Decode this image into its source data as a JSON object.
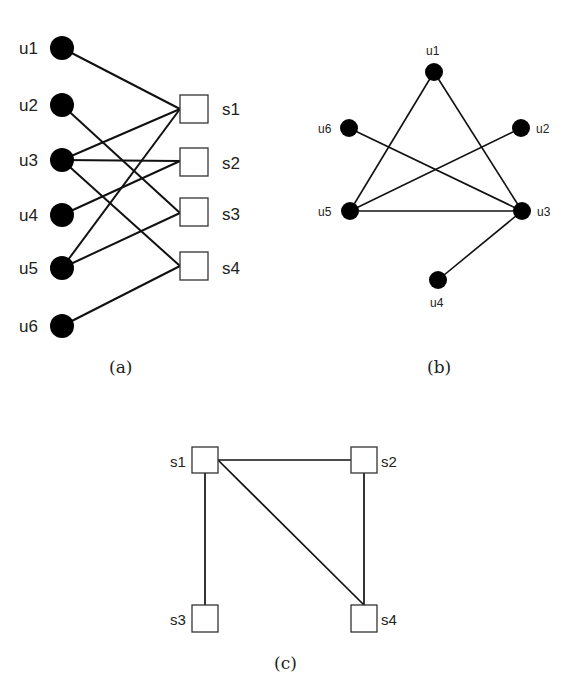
{
  "panels": [
    {
      "id": "a",
      "caption": "(a)",
      "description": "Bipartite graph between users and services",
      "user_nodes": [
        {
          "id": "u1",
          "label": "u1",
          "x": 62,
          "y": 48
        },
        {
          "id": "u2",
          "label": "u2",
          "x": 62,
          "y": 105
        },
        {
          "id": "u3",
          "label": "u3",
          "x": 62,
          "y": 160
        },
        {
          "id": "u4",
          "label": "u4",
          "x": 62,
          "y": 215
        },
        {
          "id": "u5",
          "label": "u5",
          "x": 62,
          "y": 268
        },
        {
          "id": "u6",
          "label": "u6",
          "x": 62,
          "y": 326
        }
      ],
      "service_nodes": [
        {
          "id": "s1",
          "label": "s1",
          "x": 194,
          "y": 109
        },
        {
          "id": "s2",
          "label": "s2",
          "x": 194,
          "y": 163
        },
        {
          "id": "s3",
          "label": "s3",
          "x": 194,
          "y": 213
        },
        {
          "id": "s4",
          "label": "s4",
          "x": 194,
          "y": 267
        }
      ],
      "edges": [
        [
          "u1",
          "s1"
        ],
        [
          "u2",
          "s3"
        ],
        [
          "u3",
          "s1"
        ],
        [
          "u3",
          "s2"
        ],
        [
          "u3",
          "s4"
        ],
        [
          "u4",
          "s2"
        ],
        [
          "u5",
          "s1"
        ],
        [
          "u5",
          "s3"
        ],
        [
          "u6",
          "s4"
        ]
      ]
    },
    {
      "id": "b",
      "caption": "(b)",
      "description": "User projection graph",
      "nodes": [
        {
          "id": "u1",
          "label": "u1",
          "x": 434,
          "y": 72
        },
        {
          "id": "u2",
          "label": "u2",
          "x": 521,
          "y": 128
        },
        {
          "id": "u3",
          "label": "u3",
          "x": 522,
          "y": 211
        },
        {
          "id": "u4",
          "label": "u4",
          "x": 438,
          "y": 280
        },
        {
          "id": "u5",
          "label": "u5",
          "x": 350,
          "y": 211
        },
        {
          "id": "u6",
          "label": "u6",
          "x": 349,
          "y": 128
        }
      ],
      "edges": [
        [
          "u1",
          "u5"
        ],
        [
          "u1",
          "u3"
        ],
        [
          "u6",
          "u3"
        ],
        [
          "u2",
          "u5"
        ],
        [
          "u5",
          "u3"
        ],
        [
          "u3",
          "u4"
        ]
      ]
    },
    {
      "id": "c",
      "caption": "(c)",
      "description": "Service projection graph",
      "nodes": [
        {
          "id": "s1",
          "label": "s1",
          "x": 205,
          "y": 460
        },
        {
          "id": "s2",
          "label": "s2",
          "x": 364,
          "y": 460
        },
        {
          "id": "s3",
          "label": "s3",
          "x": 205,
          "y": 618
        },
        {
          "id": "s4",
          "label": "s4",
          "x": 364,
          "y": 618
        }
      ],
      "edges": [
        [
          "s1",
          "s2"
        ],
        [
          "s1",
          "s3"
        ],
        [
          "s1",
          "s4"
        ],
        [
          "s2",
          "s4"
        ]
      ]
    }
  ]
}
